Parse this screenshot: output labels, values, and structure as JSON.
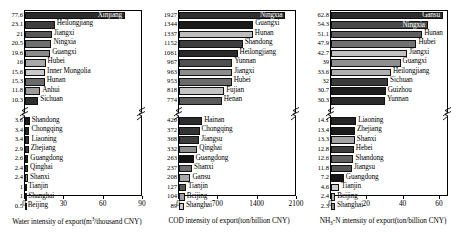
{
  "chart_data": [
    {
      "type": "bar",
      "title": "",
      "xlabel": "Water intensity of export(m³/thousand CNY)",
      "ylabel": "",
      "orientation": "horizontal",
      "xlim": [
        0,
        90
      ],
      "xticks": [
        0,
        30,
        60,
        90
      ],
      "axis_break": true,
      "categories": [
        "Xinjiang",
        "Heilongjiang",
        "Jiangxi",
        "Ningxia",
        "Guangxi",
        "Hubei",
        "Inner Mongolia",
        "Hunan",
        "Anhui",
        "Sichuan",
        "Shandong",
        "Chongqing",
        "Liaoning",
        "Zhejiang",
        "Guangdong",
        "Qinghai",
        "Shanxi",
        "Tianjin",
        "Shanghai",
        "Beijing"
      ],
      "values": [
        77.6,
        23.1,
        21,
        20.5,
        19.6,
        16,
        15.6,
        15.3,
        11.8,
        10.3,
        3.6,
        3.4,
        3.4,
        2.9,
        2.6,
        2.4,
        2.4,
        1,
        1,
        0.5
      ],
      "value_labels": [
        "77.6",
        "23.1",
        "21",
        "20.5",
        "19.6",
        "16",
        "15.6",
        "15.3",
        "11.8",
        "10.3",
        "3.6",
        "3.4",
        "3.4",
        "2.9",
        "2.6",
        "2.4",
        "2.4",
        "1",
        "1",
        "0.5"
      ],
      "colors": [
        "#2b2b2b",
        "#3f3f3f",
        "#585858",
        "#6f6f6f",
        "#8a8a8a",
        "#a8a8a8",
        "#c9c9c9",
        "#6a6a6a",
        "#9b9b9b",
        "#2e2e2e",
        "#1c1c1c",
        "#262626",
        "#303030",
        "#3a3a3a",
        "#1f1f1f",
        "#444444",
        "#8f8f8f",
        "#c0c0c0",
        "#d8d8d8",
        "#9a9a9a"
      ],
      "label_inside": [
        true,
        false,
        false,
        false,
        false,
        false,
        false,
        false,
        false,
        false,
        false,
        false,
        false,
        false,
        false,
        false,
        false,
        false,
        false,
        false
      ],
      "group_break_after": 9
    },
    {
      "type": "bar",
      "title": "",
      "xlabel": "COD intensity of export(ton/billion CNY)",
      "ylabel": "",
      "orientation": "horizontal",
      "xlim": [
        0,
        2100
      ],
      "xticks": [
        0,
        700,
        1400,
        2100
      ],
      "axis_break": true,
      "categories": [
        "Ningxia",
        "Guangxi",
        "Hunan",
        "Shandong",
        "Heilongjiang",
        "Yunnan",
        "Jiangxi",
        "Hubei",
        "Fujian",
        "Henan",
        "Hainan",
        "Chongqing",
        "Jiangsu",
        "Qinghai",
        "Guangdong",
        "Shanxi",
        "Gansu",
        "Tianjin",
        "Beijing",
        "Shanghai"
      ],
      "values": [
        1927,
        1344,
        1337,
        1152,
        1061,
        967,
        963,
        953,
        818,
        774,
        420,
        372,
        368,
        332,
        263,
        237,
        208,
        127,
        104,
        89
      ],
      "value_labels": [
        "1927",
        "1344",
        "1337",
        "1152",
        "1061",
        "967",
        "963",
        "953",
        "818",
        "774",
        "420",
        "372",
        "368",
        "332",
        "263",
        "237",
        "208",
        "127",
        "104",
        "89"
      ],
      "colors": [
        "#2f2f2f",
        "#1a1a1a",
        "#bdbdbd",
        "#3d3d3d",
        "#2a2a2a",
        "#4f4f4f",
        "#8c8c8c",
        "#6b6b6b",
        "#c4c4c4",
        "#5a5a5a",
        "#2b2b2b",
        "#333333",
        "#3c3c3c",
        "#8d8d8d",
        "#111111",
        "#6e6e6e",
        "#aaaaaa",
        "#555555",
        "#9f9f9f",
        "#cccccc"
      ],
      "label_inside": [
        true,
        false,
        false,
        false,
        false,
        false,
        false,
        false,
        false,
        false,
        false,
        false,
        false,
        false,
        false,
        false,
        false,
        false,
        false,
        false
      ],
      "group_break_after": 9
    },
    {
      "type": "bar",
      "title": "",
      "xlabel": "NH₃-N intensity of export(ton/billion CNY)",
      "ylabel": "",
      "orientation": "horizontal",
      "xlim": [
        0,
        65
      ],
      "xticks": [
        0,
        20,
        40,
        60
      ],
      "axis_break": true,
      "categories": [
        "Gansu",
        "Ningxia",
        "Hunan",
        "Hubei",
        "Jiangxi",
        "Guangxi",
        "Heilongjiang",
        "Sichuan",
        "Guizhou",
        "Yunnan",
        "Liaoning",
        "Zhejiang",
        "Shanxi",
        "Hebei",
        "Shandong",
        "Jiangsu",
        "Guangdong",
        "Tianjin",
        "Beijing",
        "Shanghai"
      ],
      "values": [
        62.8,
        54.3,
        51.1,
        47.9,
        42.7,
        39,
        33.6,
        32,
        30.7,
        30.3,
        14.1,
        13.4,
        13.3,
        12.8,
        12.6,
        11.8,
        7.2,
        4.6,
        2.4,
        2.3
      ],
      "value_labels": [
        "62.8",
        "54.3",
        "51.1",
        "47.9",
        "42.7",
        "39",
        "33.6",
        "32",
        "30.7",
        "30.3",
        "14.1",
        "13.4",
        "13.3",
        "12.8",
        "12.6",
        "11.8",
        "7.2",
        "4.6",
        "2.4",
        "2.3"
      ],
      "colors": [
        "#2c2c2c",
        "#4b4b4b",
        "#5e5e5e",
        "#717171",
        "#c2c2c2",
        "#8e8e8e",
        "#b0b0b0",
        "#3a3a3a",
        "#1d1d1d",
        "#2a2a2a",
        "#242424",
        "#1b1b1b",
        "#a5a5a5",
        "#3d3d3d",
        "#626262",
        "#555555",
        "#151515",
        "#cfcfcf",
        "#b5b5b5",
        "#8a8a8a"
      ],
      "label_inside": [
        true,
        true,
        false,
        false,
        false,
        false,
        false,
        false,
        false,
        false,
        false,
        false,
        false,
        false,
        false,
        false,
        false,
        false,
        false,
        false
      ],
      "group_break_after": 9
    }
  ]
}
